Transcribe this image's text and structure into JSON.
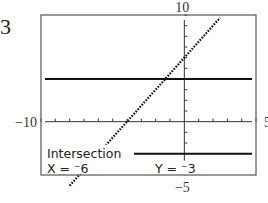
{
  "figure_number": "3",
  "chart_data": {
    "type": "line",
    "title": "",
    "xlabel": "",
    "ylabel": "",
    "xlim": [
      -10,
      5
    ],
    "ylim": [
      -5,
      10
    ],
    "xscl": 1,
    "yscl": 1,
    "window_labels": {
      "xmin": "−10",
      "xmax": "5",
      "ymin": "−5",
      "ymax": "10"
    },
    "series": [
      {
        "name": "y1",
        "style": "dotted",
        "slope": 1.5,
        "intercept": 6,
        "x_range": [
          -8,
          2.5
        ]
      },
      {
        "name": "y2",
        "style": "solid",
        "constant": 4
      },
      {
        "name": "y3",
        "style": "solid",
        "constant": -3
      }
    ],
    "annotation": {
      "label": "Intersection",
      "x_text": "X = ⁻6",
      "y_text": "Y = ⁻3",
      "point": [
        -6,
        -3
      ]
    },
    "grid": false
  }
}
